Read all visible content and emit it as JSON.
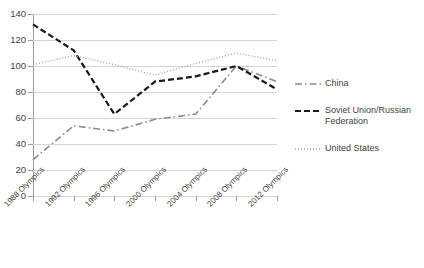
{
  "chart_data": {
    "type": "line",
    "title": "",
    "xlabel": "",
    "ylabel": "",
    "ylim": [
      0,
      140
    ],
    "ytick_step": 20,
    "grid": true,
    "legend_position": "right",
    "categories": [
      "1988 Olympics",
      "1992 Olympics",
      "1996 Olympics",
      "2000 Olympics",
      "2004 Olympics",
      "2008 Olympics",
      "2012 Olympics"
    ],
    "yticks": [
      0,
      20,
      40,
      60,
      80,
      100,
      120,
      140
    ],
    "series": [
      {
        "name": "China",
        "style": "dash-dot",
        "color": "#8c8c8c",
        "values": [
          28,
          54,
          50,
          59,
          63,
          100,
          88
        ]
      },
      {
        "name": "Soviet Union/Russian Federation",
        "style": "dashed",
        "color": "#1a1a1a",
        "values": [
          132,
          112,
          63,
          88,
          92,
          100,
          82
        ]
      },
      {
        "name": "United States",
        "style": "dotted",
        "color": "#9e9e9e",
        "values": [
          101,
          108,
          101,
          93,
          102,
          110,
          104
        ]
      }
    ]
  },
  "legend": {
    "items": [
      {
        "label": "China"
      },
      {
        "label": "Soviet Union/Russian Federation"
      },
      {
        "label": "United States"
      }
    ]
  }
}
